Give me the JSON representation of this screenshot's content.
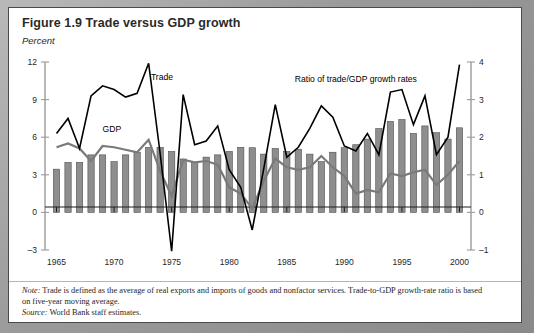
{
  "figure": {
    "title": "Figure 1.9  Trade versus GDP growth",
    "y_unit_label": "Percent"
  },
  "notes": {
    "note_prefix": "Note:",
    "note_text": " Trade is defined as the average of real exports and imports of goods and nonfactor services. Trade-to-GDP growth-rate ratio is based on five-year moving average.",
    "source_prefix": "Source:",
    "source_text": " World Bank staff estimates."
  },
  "colors": {
    "trade_line": "#000000",
    "gdp_line": "#7a7a7a",
    "bars": "#8e8e8e",
    "bar_outline": "#4f4f4f",
    "axis": "#9a9a9a",
    "frame": "#4a4a4a",
    "background": "#ffffff"
  },
  "chart_data": {
    "type": "line",
    "title": "Figure 1.9  Trade versus GDP growth",
    "subtitle": "",
    "xlabel": "",
    "ylabel": "Percent",
    "y2label": "",
    "ylim": [
      -3,
      12
    ],
    "y2lim": [
      -1,
      4
    ],
    "yticks": [
      -3,
      0,
      3,
      6,
      9,
      12
    ],
    "y2ticks": [
      -1,
      0,
      1,
      2,
      3,
      4
    ],
    "xlim": [
      1964,
      2001
    ],
    "xticks": [
      1965,
      1970,
      1975,
      1980,
      1985,
      1990,
      1995,
      2000
    ],
    "xticklabels": [
      "1965",
      "1970",
      "1975",
      "1980",
      "1985",
      "1990",
      "1995",
      "2000"
    ],
    "grid": false,
    "legend": "inline-annotations",
    "annotations": [
      {
        "text": "Trade",
        "x": 1973.2,
        "y": 10.6,
        "series": "Trade"
      },
      {
        "text": "GDP",
        "x": 1969.0,
        "y": 6.4,
        "series": "GDP"
      },
      {
        "text": "Ratio of trade/GDP growth rates",
        "x": 1991.0,
        "y": 10.4,
        "series": "Ratio of trade/GDP growth rates"
      }
    ],
    "x": [
      1965,
      1966,
      1967,
      1968,
      1969,
      1970,
      1971,
      1972,
      1973,
      1974,
      1975,
      1976,
      1977,
      1978,
      1979,
      1980,
      1981,
      1982,
      1983,
      1984,
      1985,
      1986,
      1987,
      1988,
      1989,
      1990,
      1991,
      1992,
      1993,
      1994,
      1995,
      1996,
      1997,
      1998,
      1999,
      2000
    ],
    "series": [
      {
        "name": "Trade",
        "axis": "left",
        "unit": "percent",
        "values": [
          6.3,
          7.5,
          5.1,
          9.3,
          10.1,
          9.8,
          9.2,
          9.5,
          11.9,
          4.7,
          -3.1,
          9.4,
          5.4,
          5.7,
          6.9,
          3.4,
          2.0,
          -1.4,
          3.5,
          8.6,
          4.4,
          5.2,
          6.7,
          8.5,
          7.6,
          5.3,
          4.9,
          6.3,
          4.6,
          9.6,
          9.8,
          7.0,
          9.3,
          4.6,
          6.0,
          11.8
        ]
      },
      {
        "name": "GDP",
        "axis": "left",
        "unit": "percent",
        "values": [
          5.2,
          5.5,
          5.1,
          4.1,
          5.3,
          5.2,
          5.0,
          4.8,
          5.8,
          3.3,
          1.3,
          4.2,
          4.0,
          4.1,
          3.8,
          2.0,
          1.5,
          0.3,
          2.5,
          4.3,
          3.6,
          3.4,
          3.6,
          4.5,
          3.6,
          2.9,
          1.5,
          1.8,
          1.6,
          3.1,
          2.9,
          3.2,
          3.4,
          2.2,
          3.0,
          4.1
        ]
      },
      {
        "name": "Ratio of trade/GDP growth rates",
        "axis": "right",
        "unit": "ratio",
        "values": [
          1.15,
          1.33,
          1.33,
          1.53,
          1.53,
          1.35,
          1.53,
          1.6,
          1.73,
          1.73,
          1.62,
          1.42,
          1.33,
          1.47,
          1.53,
          1.62,
          1.73,
          1.72,
          1.55,
          1.7,
          1.62,
          1.68,
          1.55,
          1.35,
          1.6,
          1.72,
          1.8,
          1.95,
          2.23,
          2.42,
          2.47,
          2.1,
          2.3,
          2.12,
          1.95,
          2.25
        ]
      }
    ]
  }
}
